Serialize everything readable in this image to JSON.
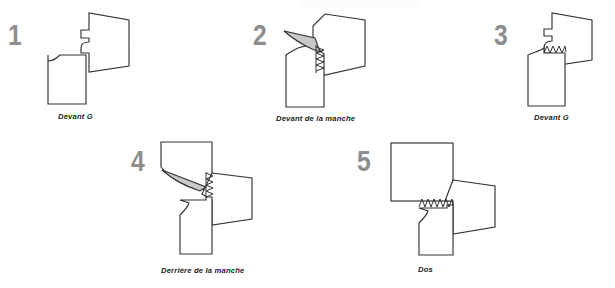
{
  "document": {
    "title": "Montage de la manche - etapes",
    "background_color": "#ffffff",
    "line_color": "#333333",
    "number_color": "#8d8d8d",
    "flap_fill_color": "#c9c9c9",
    "caption_color": "#1c1c1c"
  },
  "steps": [
    {
      "number": "1",
      "caption": "Devant G",
      "icon": "pattern-piece-front-left-icon"
    },
    {
      "number": "2",
      "caption": "Devant de la manche",
      "icon": "pattern-piece-sleeve-front-icon"
    },
    {
      "number": "3",
      "caption": "Devant G",
      "icon": "pattern-piece-front-left-stitched-icon"
    },
    {
      "number": "4",
      "caption": "Derrière de la manche",
      "icon": "pattern-piece-sleeve-back-icon"
    },
    {
      "number": "5",
      "caption": "Dos",
      "icon": "pattern-piece-back-icon"
    }
  ]
}
